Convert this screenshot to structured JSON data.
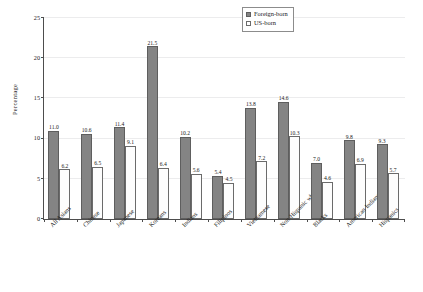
{
  "chart_data": {
    "type": "bar",
    "title": "",
    "xlabel": "",
    "ylabel": "Percentage",
    "ylim": [
      0,
      25
    ],
    "yticks": [
      0,
      5,
      10,
      15,
      20,
      25
    ],
    "grid": true,
    "legend_position": "top-right",
    "categories": [
      "All Asians",
      "Chinese",
      "Japanese",
      "Koreans",
      "Indians",
      "Filipinos",
      "Vietnamese",
      "Non-Hispanic whites",
      "Blacks",
      "American Indians",
      "Hispanics"
    ],
    "series": [
      {
        "name": "Foreign-born",
        "color": "#848484",
        "values": [
          11.0,
          10.6,
          11.4,
          21.5,
          10.2,
          5.4,
          13.8,
          14.6,
          7.0,
          9.8,
          9.3
        ],
        "labels": [
          "11.0",
          "10.6",
          "11.4",
          "21.5",
          "10.2",
          "5.4",
          "13.8",
          "14.6",
          "7.0",
          "9.8",
          "9.3"
        ]
      },
      {
        "name": "US-born",
        "color": "#ffffff",
        "values": [
          6.2,
          6.5,
          9.1,
          6.4,
          5.6,
          4.5,
          7.2,
          10.3,
          4.6,
          6.9,
          5.7
        ],
        "labels": [
          "6.2",
          "6.5",
          "9.1",
          "6.4",
          "5.6",
          "4.5",
          "7.2",
          "10.3",
          "4.6",
          "6.9",
          "5.7"
        ]
      }
    ]
  },
  "legend": {
    "items": [
      {
        "label": "Foreign-born",
        "swatch": "filled-gray"
      },
      {
        "label": "US-born",
        "swatch": "open-white"
      }
    ]
  },
  "axis": {
    "y_title": "Percentage",
    "y_tick_labels": [
      "0",
      "5",
      "10",
      "15",
      "20",
      "25"
    ]
  }
}
